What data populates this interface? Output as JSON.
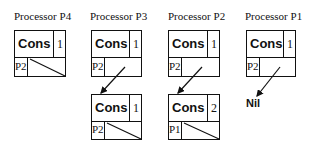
{
  "processors": [
    {
      "title": "Processor P4",
      "top": {
        "tag": "Cons",
        "count": "1",
        "owner": "P2",
        "pointer": "null"
      }
    },
    {
      "title": "Processor P3",
      "top": {
        "tag": "Cons",
        "count": "1",
        "owner": "P2",
        "pointer": "arrow"
      },
      "lower": {
        "tag": "Cons",
        "count": "1",
        "owner": "P2",
        "pointer": "null"
      }
    },
    {
      "title": "Processor P2",
      "top": {
        "tag": "Cons",
        "count": "1",
        "owner": "P2",
        "pointer": "arrow"
      },
      "lower": {
        "tag": "Cons",
        "count": "2",
        "owner": "P1",
        "pointer": "null"
      }
    },
    {
      "title": "Processor P1",
      "top": {
        "tag": "Cons",
        "count": "1",
        "owner": "P2",
        "pointer": "arrow"
      },
      "nil_label": "Nil"
    }
  ]
}
